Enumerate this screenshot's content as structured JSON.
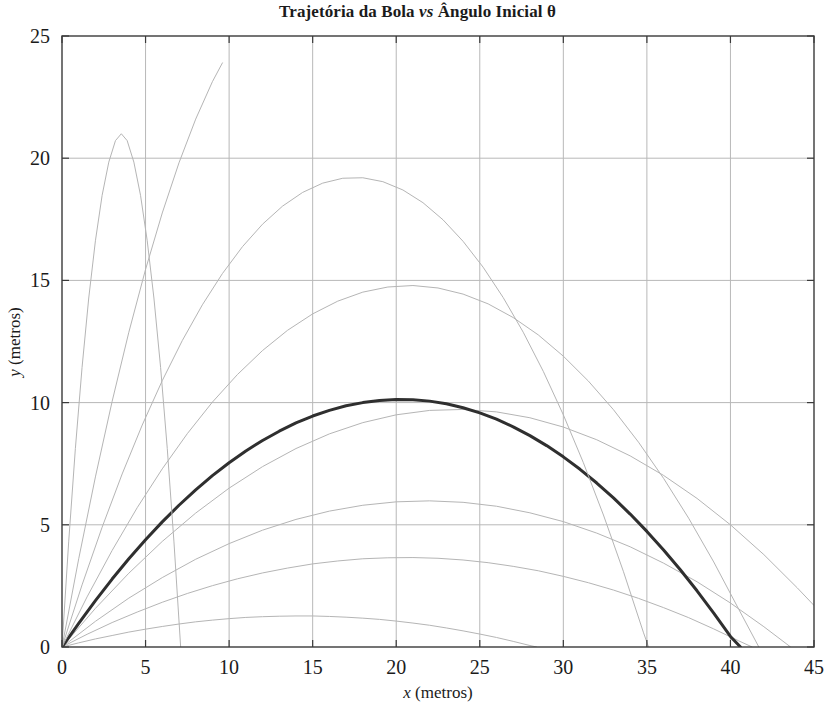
{
  "chart_data": {
    "type": "line",
    "title": "Trajetória da Bola vs Ângulo Inicial θ",
    "title_parts": {
      "before": "Trajetória da Bola ",
      "italic": "vs",
      "after": " Ângulo Inicial θ"
    },
    "xlabel": "x (metros)",
    "xlabel_parts": {
      "symbol": "x",
      "unit": " (metros)"
    },
    "ylabel": "y (metros)",
    "ylabel_parts": {
      "symbol": "y",
      "unit": " (metros)"
    },
    "xlim": [
      0,
      45
    ],
    "ylim": [
      0,
      25
    ],
    "xticks": [
      "0",
      "5",
      "10",
      "15",
      "20",
      "25",
      "30",
      "35",
      "40",
      "45"
    ],
    "yticks": [
      "0",
      "5",
      "10",
      "15",
      "20",
      "25"
    ],
    "xtick_values": [
      0,
      5,
      10,
      15,
      20,
      25,
      30,
      35,
      40,
      45
    ],
    "ytick_values": [
      0,
      5,
      10,
      15,
      20,
      25
    ],
    "grid": true,
    "grid_color": "#b8b8b8",
    "frame_color": "#3a3a3a",
    "legend": null,
    "legend_position": "none",
    "series": [
      {
        "name": "θ = 10°",
        "angle_deg": 10,
        "color": "#b5b5b5",
        "linewidth": 1,
        "highlight": false,
        "peak": {
          "x": 9.7,
          "y": 1.25
        },
        "range": 20.1,
        "points": [
          [
            0,
            0
          ],
          [
            1.0,
            0.17
          ],
          [
            2.0,
            0.33
          ],
          [
            3.0,
            0.47
          ],
          [
            4.0,
            0.61
          ],
          [
            5.0,
            0.73
          ],
          [
            6.0,
            0.84
          ],
          [
            7.0,
            0.94
          ],
          [
            8.0,
            1.03
          ],
          [
            9.0,
            1.1
          ],
          [
            10.0,
            1.16
          ],
          [
            11.0,
            1.21
          ],
          [
            12.0,
            1.24
          ],
          [
            13.0,
            1.26
          ],
          [
            14.0,
            1.27
          ],
          [
            15.0,
            1.27
          ],
          [
            16.0,
            1.25
          ],
          [
            17.0,
            1.22
          ],
          [
            18.0,
            1.18
          ],
          [
            19.0,
            1.13
          ],
          [
            20.0,
            1.06
          ],
          [
            21.0,
            0.98
          ],
          [
            22.0,
            0.89
          ],
          [
            23.0,
            0.78
          ],
          [
            24.0,
            0.66
          ],
          [
            25.0,
            0.53
          ],
          [
            26.0,
            0.39
          ],
          [
            27.0,
            0.23
          ],
          [
            28.0,
            0.06
          ],
          [
            28.4,
            0.0
          ]
        ]
      },
      {
        "name": "θ = 20°",
        "angle_deg": 20,
        "color": "#b5b5b5",
        "linewidth": 1,
        "highlight": false,
        "peak": {
          "x": 16.0,
          "y": 3.8
        },
        "range": 31.2,
        "points": [
          [
            0,
            0
          ],
          [
            1.5,
            0.52
          ],
          [
            3.0,
            1.0
          ],
          [
            4.5,
            1.43
          ],
          [
            6.0,
            1.83
          ],
          [
            7.5,
            2.19
          ],
          [
            9.0,
            2.51
          ],
          [
            10.5,
            2.79
          ],
          [
            12.0,
            3.03
          ],
          [
            13.5,
            3.23
          ],
          [
            15.0,
            3.4
          ],
          [
            16.5,
            3.52
          ],
          [
            18.0,
            3.61
          ],
          [
            19.5,
            3.65
          ],
          [
            21.0,
            3.66
          ],
          [
            22.5,
            3.63
          ],
          [
            24.0,
            3.56
          ],
          [
            25.5,
            3.45
          ],
          [
            27.0,
            3.3
          ],
          [
            28.5,
            3.12
          ],
          [
            30.0,
            2.89
          ],
          [
            31.5,
            2.63
          ],
          [
            33.0,
            2.33
          ],
          [
            34.5,
            1.99
          ],
          [
            36.0,
            1.61
          ],
          [
            37.5,
            1.2
          ],
          [
            39.0,
            0.74
          ],
          [
            40.5,
            0.25
          ],
          [
            41.3,
            0.0
          ]
        ]
      },
      {
        "name": "θ = 30°",
        "angle_deg": 30,
        "color": "#b5b5b5",
        "linewidth": 1,
        "highlight": false,
        "peak": {
          "x": 19.0,
          "y": 6.6
        },
        "range": 38.0,
        "points": [
          [
            0,
            0
          ],
          [
            2.0,
            1.05
          ],
          [
            4.0,
            2.0
          ],
          [
            6.0,
            2.84
          ],
          [
            8.0,
            3.59
          ],
          [
            10.0,
            4.23
          ],
          [
            12.0,
            4.78
          ],
          [
            14.0,
            5.22
          ],
          [
            16.0,
            5.56
          ],
          [
            18.0,
            5.8
          ],
          [
            20.0,
            5.94
          ],
          [
            22.0,
            5.98
          ],
          [
            24.0,
            5.92
          ],
          [
            26.0,
            5.76
          ],
          [
            28.0,
            5.49
          ],
          [
            30.0,
            5.13
          ],
          [
            32.0,
            4.66
          ],
          [
            34.0,
            4.1
          ],
          [
            36.0,
            3.43
          ],
          [
            38.0,
            2.67
          ],
          [
            40.0,
            1.8
          ],
          [
            42.0,
            0.83
          ],
          [
            43.6,
            0.0
          ]
        ]
      },
      {
        "name": "θ = 40°",
        "angle_deg": 40,
        "color": "#b5b5b5",
        "linewidth": 1,
        "highlight": false,
        "peak": {
          "x": 20.0,
          "y": 10.0
        },
        "range": 40.4,
        "points": [
          [
            0,
            0
          ],
          [
            2.0,
            1.58
          ],
          [
            4.0,
            3.02
          ],
          [
            6.0,
            4.32
          ],
          [
            8.0,
            5.48
          ],
          [
            10.0,
            6.5
          ],
          [
            12.0,
            7.38
          ],
          [
            14.0,
            8.12
          ],
          [
            16.0,
            8.72
          ],
          [
            18.0,
            9.18
          ],
          [
            20.0,
            9.5
          ],
          [
            22.0,
            9.68
          ],
          [
            24.0,
            9.72
          ],
          [
            26.0,
            9.62
          ],
          [
            28.0,
            9.38
          ],
          [
            30.0,
            9.0
          ],
          [
            32.0,
            8.48
          ],
          [
            34.0,
            7.82
          ],
          [
            36.0,
            7.02
          ],
          [
            38.0,
            6.08
          ],
          [
            40.0,
            5.0
          ],
          [
            42.0,
            3.78
          ],
          [
            44.0,
            2.42
          ],
          [
            45.0,
            1.7
          ]
        ]
      },
      {
        "name": "θ = 45° (ótimo)",
        "angle_deg": 45,
        "color": "#2f2f2f",
        "linewidth": 3,
        "highlight": true,
        "peak": {
          "x": 20.3,
          "y": 10.2
        },
        "range": 40.6,
        "points": [
          [
            0,
            0
          ],
          [
            1.0,
            0.97
          ],
          [
            2.0,
            1.9
          ],
          [
            3.0,
            2.78
          ],
          [
            4.0,
            3.61
          ],
          [
            5.0,
            4.39
          ],
          [
            6.0,
            5.12
          ],
          [
            7.0,
            5.8
          ],
          [
            8.0,
            6.43
          ],
          [
            9.0,
            7.01
          ],
          [
            10.0,
            7.54
          ],
          [
            11.0,
            8.02
          ],
          [
            12.0,
            8.45
          ],
          [
            13.0,
            8.83
          ],
          [
            14.0,
            9.17
          ],
          [
            15.0,
            9.45
          ],
          [
            16.0,
            9.68
          ],
          [
            17.0,
            9.87
          ],
          [
            18.0,
            10.0
          ],
          [
            19.0,
            10.09
          ],
          [
            20.0,
            10.13
          ],
          [
            21.0,
            10.12
          ],
          [
            22.0,
            10.06
          ],
          [
            23.0,
            9.95
          ],
          [
            24.0,
            9.79
          ],
          [
            25.0,
            9.58
          ],
          [
            26.0,
            9.32
          ],
          [
            27.0,
            9.01
          ],
          [
            28.0,
            8.65
          ],
          [
            29.0,
            8.24
          ],
          [
            30.0,
            7.78
          ],
          [
            31.0,
            7.27
          ],
          [
            32.0,
            6.71
          ],
          [
            33.0,
            6.1
          ],
          [
            34.0,
            5.44
          ],
          [
            35.0,
            4.73
          ],
          [
            36.0,
            3.97
          ],
          [
            37.0,
            3.16
          ],
          [
            38.0,
            2.3
          ],
          [
            39.0,
            1.39
          ],
          [
            40.0,
            0.43
          ],
          [
            40.6,
            0.0
          ]
        ]
      },
      {
        "name": "θ = 55°",
        "angle_deg": 55,
        "color": "#b5b5b5",
        "linewidth": 1,
        "highlight": false,
        "peak": {
          "x": 19.0,
          "y": 13.6
        },
        "range": 38.2,
        "points": [
          [
            0,
            0
          ],
          [
            1.5,
            2.05
          ],
          [
            3.0,
            3.95
          ],
          [
            4.5,
            5.7
          ],
          [
            6.0,
            7.29
          ],
          [
            7.5,
            8.73
          ],
          [
            9.0,
            10.02
          ],
          [
            10.5,
            11.15
          ],
          [
            12.0,
            12.13
          ],
          [
            13.5,
            12.96
          ],
          [
            15.0,
            13.63
          ],
          [
            16.5,
            14.15
          ],
          [
            18.0,
            14.52
          ],
          [
            19.5,
            14.73
          ],
          [
            21.0,
            14.79
          ],
          [
            22.5,
            14.69
          ],
          [
            24.0,
            14.44
          ],
          [
            25.5,
            14.04
          ],
          [
            27.0,
            13.48
          ],
          [
            28.5,
            12.77
          ],
          [
            30.0,
            11.9
          ],
          [
            31.5,
            10.88
          ],
          [
            33.0,
            9.71
          ],
          [
            34.5,
            8.38
          ],
          [
            36.0,
            6.9
          ],
          [
            37.5,
            5.27
          ],
          [
            39.0,
            3.48
          ],
          [
            40.5,
            1.54
          ],
          [
            41.7,
            0.0
          ]
        ]
      },
      {
        "name": "θ = 65°",
        "angle_deg": 65,
        "color": "#b5b5b5",
        "linewidth": 1,
        "highlight": false,
        "peak": {
          "x": 15.4,
          "y": 16.6
        },
        "range": 31.2,
        "points": [
          [
            0,
            0
          ],
          [
            1.2,
            2.54
          ],
          [
            2.4,
            4.9
          ],
          [
            3.6,
            7.08
          ],
          [
            4.8,
            9.08
          ],
          [
            6.0,
            10.9
          ],
          [
            7.2,
            12.54
          ],
          [
            8.4,
            14.0
          ],
          [
            9.6,
            15.28
          ],
          [
            10.8,
            16.38
          ],
          [
            12.0,
            17.3
          ],
          [
            13.2,
            18.04
          ],
          [
            14.4,
            18.6
          ],
          [
            15.6,
            18.98
          ],
          [
            16.8,
            19.18
          ],
          [
            18.0,
            19.2
          ],
          [
            19.2,
            19.04
          ],
          [
            20.4,
            18.7
          ],
          [
            21.6,
            18.18
          ],
          [
            22.8,
            17.48
          ],
          [
            24.0,
            16.6
          ],
          [
            25.2,
            15.54
          ],
          [
            26.4,
            14.3
          ],
          [
            27.6,
            12.88
          ],
          [
            28.8,
            11.28
          ],
          [
            30.0,
            9.5
          ],
          [
            31.2,
            7.54
          ],
          [
            32.4,
            5.4
          ],
          [
            33.6,
            3.08
          ],
          [
            34.8,
            0.58
          ],
          [
            35.1,
            0.0
          ]
        ]
      },
      {
        "name": "θ = 75°",
        "angle_deg": 75,
        "color": "#b5b5b5",
        "linewidth": 1,
        "highlight": false,
        "peak": {
          "x": 10.3,
          "y": 18.9
        },
        "range": 20.6,
        "points": [
          [
            0,
            0
          ],
          [
            1.0,
            3.61
          ],
          [
            2.0,
            6.96
          ],
          [
            3.0,
            10.05
          ],
          [
            4.0,
            12.88
          ],
          [
            5.0,
            15.45
          ],
          [
            6.0,
            17.76
          ],
          [
            7.0,
            19.81
          ],
          [
            8.0,
            21.6
          ],
          [
            9.0,
            23.13
          ],
          [
            9.6,
            23.9
          ]
        ]
      },
      {
        "name": "θ = 80°",
        "angle_deg": 80,
        "color": "#b5b5b5",
        "linewidth": 1,
        "highlight": false,
        "peak": {
          "x": 3.55,
          "y": 20.1
        },
        "range": 7.1,
        "points": [
          [
            0,
            0
          ],
          [
            0.4,
            4.3
          ],
          [
            0.8,
            8.12
          ],
          [
            1.2,
            11.44
          ],
          [
            1.6,
            14.28
          ],
          [
            2.0,
            16.62
          ],
          [
            2.4,
            18.48
          ],
          [
            2.8,
            19.84
          ],
          [
            3.2,
            20.72
          ],
          [
            3.55,
            21.0
          ],
          [
            3.9,
            20.72
          ],
          [
            4.3,
            19.84
          ],
          [
            4.7,
            18.48
          ],
          [
            5.1,
            16.62
          ],
          [
            5.5,
            14.28
          ],
          [
            5.9,
            11.44
          ],
          [
            6.3,
            8.12
          ],
          [
            6.7,
            4.3
          ],
          [
            7.1,
            0.0
          ]
        ]
      }
    ]
  },
  "caption": ""
}
